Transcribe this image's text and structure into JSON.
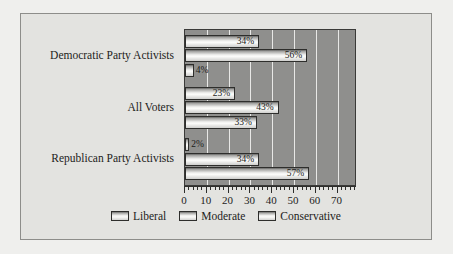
{
  "chart_data": {
    "type": "bar",
    "orientation": "horizontal",
    "title": "",
    "xlabel": "",
    "ylabel": "",
    "xlim": [
      0,
      78
    ],
    "xticks": [
      0,
      10,
      20,
      30,
      40,
      50,
      60,
      70
    ],
    "xtick_labels": [
      "0",
      "10",
      "20",
      "30",
      "40",
      "50",
      "60",
      "70"
    ],
    "minor_tick_step": 2,
    "grid": "vertical",
    "legend_position": "bottom-center",
    "categories": [
      "Democratic Party Activists",
      "All Voters",
      "Republican Party Activists"
    ],
    "series": [
      {
        "name": "Liberal",
        "values": [
          34,
          23,
          2
        ],
        "labels": [
          "34%",
          "23%",
          "2%"
        ]
      },
      {
        "name": "Moderate",
        "values": [
          56,
          43,
          34
        ],
        "labels": [
          "56%",
          "43%",
          "34%"
        ]
      },
      {
        "name": "Conservative",
        "values": [
          4,
          33,
          57
        ],
        "labels": [
          "4%",
          "33%",
          "57%"
        ]
      }
    ]
  },
  "legend": {
    "items": [
      {
        "label": "Liberal"
      },
      {
        "label": "Moderate"
      },
      {
        "label": "Conservative"
      }
    ]
  },
  "colors": {
    "page_background": "#efefed",
    "figure_background": "#e3e3e0",
    "plot_background": "#8f8f8d",
    "gridline": "#e8e8e6",
    "bar_border": "#2e2e2c",
    "bar_fill_light": "#fbfbf9",
    "text": "#1d1d1b"
  }
}
